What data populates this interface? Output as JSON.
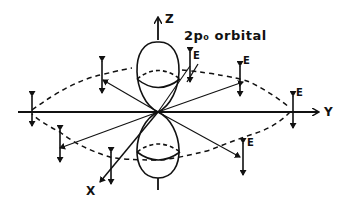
{
  "diagram": {
    "title": "2p₀ orbital",
    "axes": {
      "z": "Z",
      "y": "Y",
      "x": "X"
    },
    "field_label": "E",
    "field_label_variant": "E",
    "colors": {
      "ink": "#111111",
      "background": "#ffffff"
    }
  }
}
